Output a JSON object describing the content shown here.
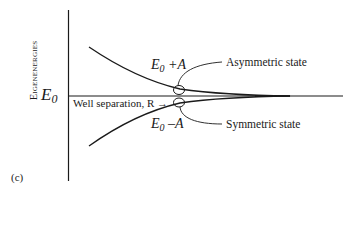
{
  "diagram": {
    "panel_label": "(c)",
    "y_axis_label": "Eigenenergies",
    "baseline_label": {
      "symbol": "E",
      "subscript": "0"
    },
    "upper_curve_label": {
      "symbol": "E",
      "subscript": "0",
      "suffix": " +A"
    },
    "lower_curve_label": {
      "symbol": "E",
      "subscript": "0",
      "suffix": " –A"
    },
    "x_axis_annotation": "Well separation, R",
    "x_axis_arrow": "→",
    "callouts": {
      "upper": "Asymmetric state",
      "lower": "Symmetric state"
    },
    "colors": {
      "line": "#1a1a1a",
      "background": "#ffffff"
    }
  }
}
